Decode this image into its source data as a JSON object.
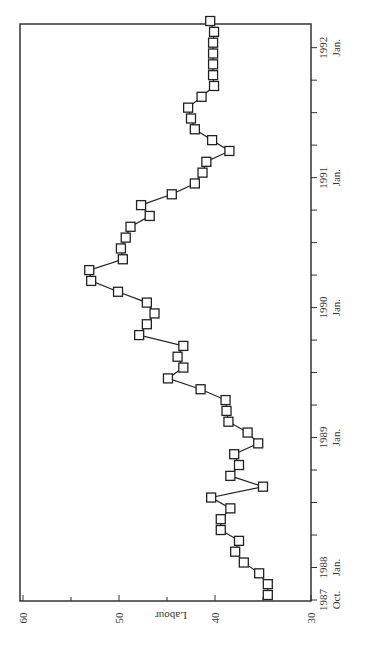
{
  "chart_data": {
    "type": "line",
    "orientation": "rotated-90",
    "title": "",
    "xlabel": "",
    "ylabel": "Labour",
    "ylim": [
      30,
      60
    ],
    "y_ticks": [
      "30",
      "40",
      "50",
      "60"
    ],
    "x_tick_labels": [
      {
        "year": "1987",
        "month": "Oct."
      },
      {
        "year": "1988",
        "month": "Jan."
      },
      {
        "year": "1989",
        "month": "Jan."
      },
      {
        "year": "1990",
        "month": "Jan."
      },
      {
        "year": "1991",
        "month": "Jan."
      },
      {
        "year": "1992",
        "month": "Jan."
      }
    ],
    "x_tick_interval": "quarterly",
    "grid": false,
    "legend": null,
    "marker": "open-square",
    "series": [
      {
        "name": "Labour",
        "x_start": "1987-10",
        "x_step": "month",
        "values": [
          34.5,
          34.5,
          35.4,
          37.0,
          37.9,
          37.5,
          39.4,
          39.4,
          38.4,
          40.4,
          35.0,
          38.4,
          37.5,
          38.0,
          35.5,
          36.6,
          38.6,
          38.8,
          38.9,
          41.5,
          44.9,
          43.3,
          43.9,
          43.3,
          47.9,
          47.1,
          46.3,
          47.1,
          50.1,
          52.9,
          53.1,
          49.6,
          49.8,
          49.3,
          48.8,
          46.8,
          47.7,
          44.5,
          42.1,
          41.3,
          40.9,
          38.5,
          40.3,
          42.1,
          42.5,
          42.8,
          41.4,
          40.1,
          40.2,
          40.2,
          40.2,
          40.2,
          40.1,
          40.5
        ]
      }
    ]
  }
}
